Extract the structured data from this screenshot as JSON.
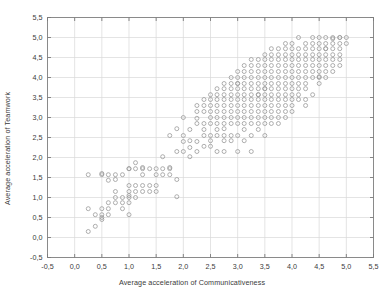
{
  "chart_data": {
    "type": "scatter",
    "title": "",
    "xlabel": "Average acceleration of Communicativeness",
    "ylabel": "Average acceleration of Teamwork",
    "xlim": [
      -0.5,
      5.5
    ],
    "ylim": [
      -0.5,
      5.5
    ],
    "xticks": [
      "-0,5",
      "0,0",
      "0,5",
      "1,0",
      "1,5",
      "2,0",
      "2,5",
      "3,0",
      "3,5",
      "4,0",
      "4,5",
      "5,0",
      "5,5"
    ],
    "yticks": [
      "-0,5",
      "0,0",
      "0,5",
      "1,0",
      "1,5",
      "2,0",
      "2,5",
      "3,0",
      "3,5",
      "4,0",
      "4,5",
      "5,0",
      "5,5"
    ],
    "xtick_values": [
      -0.5,
      0.0,
      0.5,
      1.0,
      1.5,
      2.0,
      2.5,
      3.0,
      3.5,
      4.0,
      4.5,
      5.0,
      5.5
    ],
    "ytick_values": [
      -0.5,
      0.0,
      0.5,
      1.0,
      1.5,
      2.0,
      2.5,
      3.0,
      3.5,
      4.0,
      4.5,
      5.0,
      5.5
    ],
    "grid": true,
    "legend": null,
    "marker": "open-circle",
    "marker_color": "#9a9a9a",
    "marker_size": 4,
    "decimal_separator": ",",
    "points": [
      [
        0.25,
        0.15
      ],
      [
        0.25,
        0.72
      ],
      [
        0.25,
        1.57
      ],
      [
        0.38,
        0.28
      ],
      [
        0.38,
        0.57
      ],
      [
        0.5,
        0.45
      ],
      [
        0.5,
        0.5
      ],
      [
        0.5,
        0.57
      ],
      [
        0.5,
        0.72
      ],
      [
        0.5,
        1.57
      ],
      [
        0.5,
        1.6
      ],
      [
        0.62,
        0.57
      ],
      [
        0.62,
        0.87
      ],
      [
        0.62,
        1.43
      ],
      [
        0.62,
        1.57
      ],
      [
        0.75,
        1.0
      ],
      [
        0.75,
        1.15
      ],
      [
        0.75,
        1.45
      ],
      [
        0.75,
        1.57
      ],
      [
        0.88,
        0.72
      ],
      [
        0.88,
        0.87
      ],
      [
        0.88,
        1.0
      ],
      [
        0.88,
        1.57
      ],
      [
        1.0,
        0.57
      ],
      [
        1.0,
        0.87
      ],
      [
        1.0,
        1.0
      ],
      [
        1.0,
        1.05
      ],
      [
        1.0,
        1.15
      ],
      [
        1.0,
        1.3
      ],
      [
        1.0,
        1.72
      ],
      [
        1.12,
        1.15
      ],
      [
        1.12,
        1.3
      ],
      [
        1.12,
        1.72
      ],
      [
        1.12,
        1.87
      ],
      [
        1.25,
        1.15
      ],
      [
        1.25,
        1.3
      ],
      [
        1.25,
        1.57
      ],
      [
        1.25,
        1.72
      ],
      [
        1.25,
        1.75
      ],
      [
        1.38,
        1.3
      ],
      [
        1.38,
        1.72
      ],
      [
        1.5,
        1.15
      ],
      [
        1.5,
        1.3
      ],
      [
        1.5,
        1.57
      ],
      [
        1.5,
        1.72
      ],
      [
        1.62,
        1.72
      ],
      [
        1.62,
        2.02
      ],
      [
        1.75,
        1.57
      ],
      [
        1.75,
        1.72
      ],
      [
        1.75,
        1.75
      ],
      [
        1.88,
        1.02
      ],
      [
        1.88,
        1.45
      ],
      [
        2.0,
        2.15
      ],
      [
        2.12,
        2.02
      ],
      [
        2.12,
        2.25
      ],
      [
        2.25,
        2.15
      ],
      [
        2.25,
        2.4
      ],
      [
        2.38,
        2.28
      ],
      [
        2.5,
        2.28
      ],
      [
        2.5,
        2.42
      ],
      [
        2.5,
        2.55
      ],
      [
        2.62,
        2.15
      ],
      [
        2.62,
        2.7
      ],
      [
        2.75,
        2.42
      ],
      [
        2.75,
        2.55
      ],
      [
        2.75,
        2.72
      ],
      [
        2.88,
        2.55
      ],
      [
        3.0,
        2.15
      ],
      [
        3.25,
        2.15
      ],
      [
        2.0,
        2.55
      ],
      [
        2.12,
        2.7
      ],
      [
        1.75,
        2.55
      ],
      [
        1.88,
        2.72
      ],
      [
        2.25,
        2.85
      ],
      [
        2.38,
        2.7
      ],
      [
        2.38,
        2.85
      ],
      [
        2.5,
        2.85
      ],
      [
        2.5,
        3.0
      ],
      [
        2.62,
        2.85
      ],
      [
        2.62,
        3.0
      ],
      [
        2.75,
        2.85
      ],
      [
        2.75,
        3.0
      ],
      [
        2.88,
        2.85
      ],
      [
        2.88,
        3.0
      ],
      [
        3.0,
        2.85
      ],
      [
        3.0,
        3.0
      ],
      [
        3.12,
        2.85
      ],
      [
        3.12,
        3.0
      ],
      [
        3.25,
        2.85
      ],
      [
        3.25,
        3.0
      ],
      [
        3.38,
        2.85
      ],
      [
        3.38,
        3.0
      ],
      [
        3.5,
        2.85
      ],
      [
        3.5,
        3.0
      ],
      [
        3.62,
        3.0
      ],
      [
        3.75,
        3.0
      ],
      [
        3.88,
        3.0
      ],
      [
        2.0,
        3.0
      ],
      [
        2.25,
        3.15
      ],
      [
        2.38,
        3.15
      ],
      [
        2.5,
        3.15
      ],
      [
        2.62,
        3.15
      ],
      [
        2.75,
        3.15
      ],
      [
        2.88,
        3.15
      ],
      [
        3.0,
        3.15
      ],
      [
        3.12,
        3.15
      ],
      [
        3.25,
        3.15
      ],
      [
        3.38,
        3.15
      ],
      [
        3.5,
        3.15
      ],
      [
        3.62,
        3.15
      ],
      [
        3.75,
        3.15
      ],
      [
        2.25,
        3.3
      ],
      [
        2.38,
        3.3
      ],
      [
        2.5,
        3.3
      ],
      [
        2.62,
        3.3
      ],
      [
        2.75,
        3.3
      ],
      [
        2.88,
        3.3
      ],
      [
        3.0,
        3.3
      ],
      [
        3.12,
        3.3
      ],
      [
        3.25,
        3.3
      ],
      [
        3.38,
        3.3
      ],
      [
        3.5,
        3.3
      ],
      [
        3.62,
        3.3
      ],
      [
        3.75,
        3.3
      ],
      [
        3.88,
        3.3
      ],
      [
        4.0,
        3.3
      ],
      [
        2.38,
        3.45
      ],
      [
        2.5,
        3.45
      ],
      [
        2.62,
        3.45
      ],
      [
        2.75,
        3.45
      ],
      [
        2.88,
        3.45
      ],
      [
        3.0,
        3.45
      ],
      [
        3.12,
        3.45
      ],
      [
        3.25,
        3.45
      ],
      [
        3.38,
        3.45
      ],
      [
        3.5,
        3.45
      ],
      [
        3.62,
        3.45
      ],
      [
        3.75,
        3.45
      ],
      [
        3.88,
        3.45
      ],
      [
        4.0,
        3.45
      ],
      [
        4.12,
        3.45
      ],
      [
        2.5,
        3.57
      ],
      [
        2.62,
        3.57
      ],
      [
        2.75,
        3.57
      ],
      [
        2.88,
        3.57
      ],
      [
        3.0,
        3.57
      ],
      [
        3.12,
        3.57
      ],
      [
        3.25,
        3.57
      ],
      [
        3.38,
        3.57
      ],
      [
        3.5,
        3.57
      ],
      [
        3.62,
        3.57
      ],
      [
        3.75,
        3.57
      ],
      [
        3.88,
        3.57
      ],
      [
        4.0,
        3.57
      ],
      [
        4.12,
        3.57
      ],
      [
        2.62,
        3.72
      ],
      [
        2.75,
        3.72
      ],
      [
        2.88,
        3.72
      ],
      [
        3.0,
        3.72
      ],
      [
        3.12,
        3.72
      ],
      [
        3.25,
        3.72
      ],
      [
        3.38,
        3.72
      ],
      [
        3.5,
        3.72
      ],
      [
        3.62,
        3.72
      ],
      [
        3.75,
        3.72
      ],
      [
        3.88,
        3.72
      ],
      [
        4.0,
        3.72
      ],
      [
        4.12,
        3.72
      ],
      [
        4.25,
        3.72
      ],
      [
        2.75,
        3.85
      ],
      [
        2.88,
        3.85
      ],
      [
        3.0,
        3.85
      ],
      [
        3.12,
        3.85
      ],
      [
        3.25,
        3.85
      ],
      [
        3.38,
        3.85
      ],
      [
        3.5,
        3.85
      ],
      [
        3.62,
        3.85
      ],
      [
        3.75,
        3.85
      ],
      [
        3.88,
        3.85
      ],
      [
        4.0,
        3.85
      ],
      [
        4.12,
        3.85
      ],
      [
        4.25,
        3.85
      ],
      [
        4.5,
        3.85
      ],
      [
        2.88,
        4.0
      ],
      [
        3.0,
        4.0
      ],
      [
        3.12,
        4.0
      ],
      [
        3.25,
        4.0
      ],
      [
        3.38,
        4.0
      ],
      [
        3.5,
        4.0
      ],
      [
        3.62,
        4.0
      ],
      [
        3.75,
        4.0
      ],
      [
        3.88,
        4.0
      ],
      [
        4.0,
        4.0
      ],
      [
        4.12,
        4.0
      ],
      [
        4.25,
        4.0
      ],
      [
        4.38,
        4.0
      ],
      [
        4.5,
        4.0
      ],
      [
        3.0,
        4.15
      ],
      [
        3.12,
        4.15
      ],
      [
        3.25,
        4.15
      ],
      [
        3.38,
        4.15
      ],
      [
        3.5,
        4.15
      ],
      [
        3.62,
        4.15
      ],
      [
        3.75,
        4.15
      ],
      [
        3.88,
        4.15
      ],
      [
        4.0,
        4.15
      ],
      [
        4.12,
        4.15
      ],
      [
        4.25,
        4.15
      ],
      [
        4.38,
        4.15
      ],
      [
        4.5,
        4.15
      ],
      [
        4.62,
        4.15
      ],
      [
        3.12,
        4.3
      ],
      [
        3.25,
        4.3
      ],
      [
        3.38,
        4.3
      ],
      [
        3.5,
        4.3
      ],
      [
        3.62,
        4.3
      ],
      [
        3.75,
        4.3
      ],
      [
        3.88,
        4.3
      ],
      [
        4.0,
        4.3
      ],
      [
        4.12,
        4.3
      ],
      [
        4.25,
        4.3
      ],
      [
        4.38,
        4.3
      ],
      [
        4.5,
        4.3
      ],
      [
        4.62,
        4.3
      ],
      [
        4.75,
        4.3
      ],
      [
        3.25,
        4.45
      ],
      [
        3.38,
        4.45
      ],
      [
        3.5,
        4.45
      ],
      [
        3.62,
        4.45
      ],
      [
        3.75,
        4.45
      ],
      [
        3.88,
        4.45
      ],
      [
        4.0,
        4.45
      ],
      [
        4.12,
        4.45
      ],
      [
        4.25,
        4.45
      ],
      [
        4.38,
        4.45
      ],
      [
        4.5,
        4.45
      ],
      [
        4.62,
        4.45
      ],
      [
        4.75,
        4.45
      ],
      [
        4.88,
        4.45
      ],
      [
        3.5,
        4.57
      ],
      [
        3.62,
        4.57
      ],
      [
        3.75,
        4.57
      ],
      [
        3.88,
        4.57
      ],
      [
        4.0,
        4.57
      ],
      [
        4.12,
        4.57
      ],
      [
        4.25,
        4.57
      ],
      [
        4.38,
        4.57
      ],
      [
        4.5,
        4.57
      ],
      [
        4.62,
        4.57
      ],
      [
        4.75,
        4.57
      ],
      [
        4.88,
        4.57
      ],
      [
        3.62,
        4.72
      ],
      [
        3.75,
        4.72
      ],
      [
        3.88,
        4.72
      ],
      [
        4.0,
        4.72
      ],
      [
        4.12,
        4.72
      ],
      [
        4.25,
        4.72
      ],
      [
        4.38,
        4.72
      ],
      [
        4.5,
        4.72
      ],
      [
        4.62,
        4.72
      ],
      [
        4.75,
        4.72
      ],
      [
        4.88,
        4.72
      ],
      [
        3.88,
        4.85
      ],
      [
        4.0,
        4.85
      ],
      [
        4.25,
        4.85
      ],
      [
        4.38,
        4.85
      ],
      [
        4.5,
        4.85
      ],
      [
        4.62,
        4.85
      ],
      [
        4.75,
        4.85
      ],
      [
        4.88,
        4.85
      ],
      [
        4.12,
        5.0
      ],
      [
        4.38,
        5.0
      ],
      [
        4.5,
        5.0
      ],
      [
        4.62,
        5.0
      ],
      [
        4.75,
        5.0
      ],
      [
        4.88,
        5.0
      ],
      [
        5.0,
        5.0
      ],
      [
        4.75,
        4.97
      ],
      [
        2.25,
        2.98
      ],
      [
        3.62,
        2.85
      ],
      [
        3.38,
        2.7
      ],
      [
        3.5,
        2.55
      ],
      [
        3.25,
        2.55
      ],
      [
        3.12,
        2.42
      ],
      [
        3.0,
        2.55
      ],
      [
        3.12,
        2.7
      ],
      [
        2.88,
        2.42
      ],
      [
        4.5,
        4.02
      ],
      [
        4.62,
        4.72
      ],
      [
        2.62,
        2.55
      ],
      [
        3.0,
        3.85
      ],
      [
        4.38,
        3.57
      ],
      [
        4.25,
        3.45
      ],
      [
        4.0,
        3.15
      ],
      [
        3.88,
        3.15
      ],
      [
        4.88,
        4.3
      ],
      [
        4.75,
        4.15
      ],
      [
        4.62,
        4.0
      ],
      [
        1.12,
        1.0
      ],
      [
        1.0,
        1.72
      ],
      [
        1.38,
        1.15
      ],
      [
        1.62,
        1.57
      ],
      [
        1.88,
        2.15
      ],
      [
        2.0,
        2.4
      ],
      [
        0.75,
        0.87
      ],
      [
        0.62,
        0.72
      ],
      [
        4.25,
        3.3
      ],
      [
        5.0,
        4.85
      ],
      [
        4.88,
        5.0
      ],
      [
        3.75,
        2.85
      ],
      [
        2.75,
        2.15
      ],
      [
        2.38,
        2.55
      ],
      [
        2.12,
        2.42
      ],
      [
        3.38,
        3.57
      ],
      [
        3.5,
        3.72
      ]
    ]
  }
}
